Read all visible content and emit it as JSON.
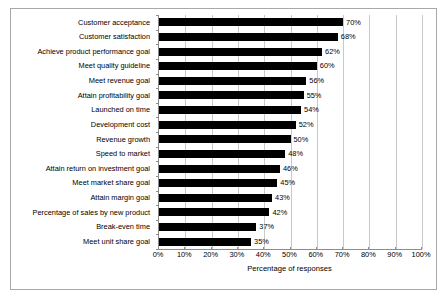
{
  "chart_data": {
    "type": "bar",
    "orientation": "horizontal",
    "title": "",
    "xlabel": "Percentage of responses",
    "ylabel": "",
    "xlim": [
      0,
      100
    ],
    "xticks": [
      "0%",
      "10%",
      "20%",
      "30%",
      "40%",
      "50%",
      "60%",
      "70%",
      "80%",
      "90%",
      "100%"
    ],
    "xtick_values": [
      0,
      10,
      20,
      30,
      40,
      50,
      60,
      70,
      80,
      90,
      100
    ],
    "grid": "vertical",
    "legend": "none",
    "bar_color": "#000000",
    "categories": [
      "Customer acceptance",
      "Customer satisfaction",
      "Achieve product performance goal",
      "Meet quality guideline",
      "Meet revenue goal",
      "Attain profitability goal",
      "Launched on time",
      "Development cost",
      "Revenue growth",
      "Speed to market",
      "Attain return on investment goal",
      "Meet market share goal",
      "Attain margin goal",
      "Percentage of sales by new product",
      "Break-even time",
      "Meet unit share goal"
    ],
    "values": [
      70,
      68,
      62,
      60,
      56,
      55,
      54,
      52,
      50,
      48,
      46,
      45,
      43,
      42,
      37,
      35
    ],
    "value_labels": [
      "70%",
      "68%",
      "62%",
      "60%",
      "56%",
      "55%",
      "54%",
      "52%",
      "50%",
      "48%",
      "46%",
      "45%",
      "43%",
      "42%",
      "37%",
      "35%"
    ]
  },
  "frame": {
    "border_color": "#a8a8a8",
    "background": "#ffffff"
  }
}
